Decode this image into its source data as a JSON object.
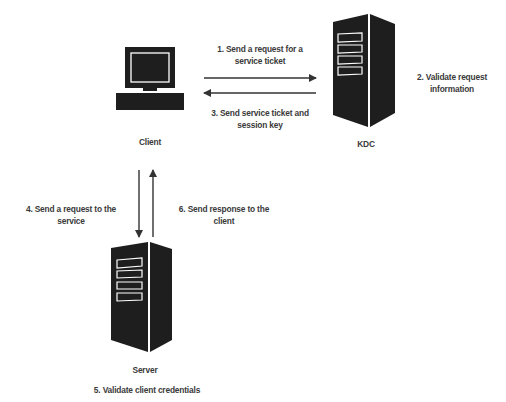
{
  "diagram": {
    "nodes": {
      "client": {
        "label": "Client",
        "icon": "desktop-computer-icon"
      },
      "kdc": {
        "label": "KDC",
        "icon": "server-tower-icon"
      },
      "server": {
        "label": "Server",
        "icon": "server-tower-icon"
      }
    },
    "steps": [
      {
        "id": 1,
        "line1": "1. Send a request for a",
        "line2": "service ticket",
        "from": "client",
        "to": "kdc"
      },
      {
        "id": 2,
        "line1": "2. Validate request",
        "line2": "information",
        "at": "kdc"
      },
      {
        "id": 3,
        "line1": "3. Send service ticket and",
        "line2": "session key",
        "from": "kdc",
        "to": "client"
      },
      {
        "id": 4,
        "line1": "4. Send a request to the",
        "line2": "service",
        "from": "client",
        "to": "server"
      },
      {
        "id": 5,
        "line1": "5. Validate client credentials",
        "line2": "",
        "at": "server"
      },
      {
        "id": 6,
        "line1": "6. Send response to the",
        "line2": "client",
        "from": "server",
        "to": "client"
      }
    ],
    "colors": {
      "icon": "#1e1e1e",
      "arrow": "#333333",
      "text": "#3a3a3a",
      "background": "#ffffff"
    }
  }
}
